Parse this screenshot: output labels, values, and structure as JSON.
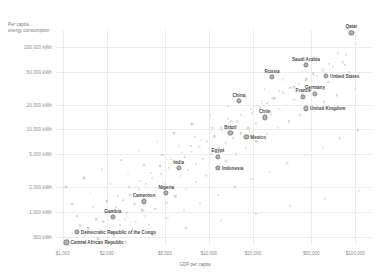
{
  "chart_data": {
    "type": "scatter",
    "title": "",
    "ylabel": "Per capita energy consumption",
    "ylabel_line1": "Per capita",
    "ylabel_line2": "energy consumption",
    "xlabel": "GDP per capita",
    "xscale": "log",
    "yscale": "log",
    "xlim": [
      900,
      130000
    ],
    "ylim": [
      400,
      160000
    ],
    "grid": true,
    "legend": "none",
    "xticks": [
      {
        "value": 1000,
        "label": "$1,000"
      },
      {
        "value": 2000,
        "label": "$2,000"
      },
      {
        "value": 5000,
        "label": "$5,000"
      },
      {
        "value": 10000,
        "label": "$10,000"
      },
      {
        "value": 20000,
        "label": "$20,000"
      },
      {
        "value": 50000,
        "label": "$50,000"
      },
      {
        "value": 100000,
        "label": "$100,000"
      }
    ],
    "yticks": [
      {
        "value": 100000,
        "label": "100,000 kWh"
      },
      {
        "value": 50000,
        "label": "50,000 kWh"
      },
      {
        "value": 20000,
        "label": "20,000 kWh"
      },
      {
        "value": 10000,
        "label": "10,000 kWh"
      },
      {
        "value": 5000,
        "label": "5,000 kWh"
      },
      {
        "value": 2000,
        "label": "2,000 kWh"
      },
      {
        "value": 1000,
        "label": "1,000 kWh"
      },
      {
        "value": 500,
        "label": "500 kWh"
      }
    ],
    "labeled_points": [
      {
        "name": "Qatar",
        "x": 94000,
        "y": 148000,
        "label_pos": "above"
      },
      {
        "name": "Saudi Arabia",
        "x": 46000,
        "y": 60000,
        "label_pos": "above"
      },
      {
        "name": "United States",
        "x": 63000,
        "y": 45000,
        "label_pos": "right"
      },
      {
        "name": "Russia",
        "x": 27000,
        "y": 43000,
        "label_pos": "above"
      },
      {
        "name": "Germany",
        "x": 53000,
        "y": 27000,
        "label_pos": "above"
      },
      {
        "name": "France",
        "x": 44000,
        "y": 25000,
        "label_pos": "above"
      },
      {
        "name": "United Kingdom",
        "x": 46000,
        "y": 18000,
        "label_pos": "right"
      },
      {
        "name": "China",
        "x": 16000,
        "y": 22000,
        "label_pos": "above"
      },
      {
        "name": "Chile",
        "x": 24000,
        "y": 14000,
        "label_pos": "above"
      },
      {
        "name": "Brazil",
        "x": 14000,
        "y": 9000,
        "label_pos": "above"
      },
      {
        "name": "Mexico",
        "x": 18000,
        "y": 8200,
        "label_pos": "right"
      },
      {
        "name": "Egypt",
        "x": 11500,
        "y": 4700,
        "label_pos": "above"
      },
      {
        "name": "Indonesia",
        "x": 11500,
        "y": 3400,
        "label_pos": "right"
      },
      {
        "name": "India",
        "x": 6200,
        "y": 3400,
        "label_pos": "above"
      },
      {
        "name": "Nigeria",
        "x": 5100,
        "y": 1700,
        "label_pos": "above"
      },
      {
        "name": "Cameroon",
        "x": 3600,
        "y": 1350,
        "label_pos": "above"
      },
      {
        "name": "Gambia",
        "x": 2200,
        "y": 870,
        "label_pos": "above"
      },
      {
        "name": "Democratic Republic of the Congo",
        "x": 1250,
        "y": 580,
        "label_pos": "right"
      },
      {
        "name": "Central African Republic",
        "x": 1060,
        "y": 430,
        "label_pos": "right"
      }
    ],
    "background_points": [
      {
        "x": 1180,
        "y": 560
      },
      {
        "x": 1320,
        "y": 700
      },
      {
        "x": 1500,
        "y": 640
      },
      {
        "x": 1700,
        "y": 820
      },
      {
        "x": 1900,
        "y": 760
      },
      {
        "x": 2050,
        "y": 1000
      },
      {
        "x": 2300,
        "y": 1150
      },
      {
        "x": 2450,
        "y": 700
      },
      {
        "x": 2600,
        "y": 1400
      },
      {
        "x": 2750,
        "y": 980
      },
      {
        "x": 2900,
        "y": 1600
      },
      {
        "x": 3100,
        "y": 1250
      },
      {
        "x": 3300,
        "y": 1900
      },
      {
        "x": 3500,
        "y": 1050
      },
      {
        "x": 3700,
        "y": 2200
      },
      {
        "x": 3900,
        "y": 1650
      },
      {
        "x": 4100,
        "y": 2600
      },
      {
        "x": 4400,
        "y": 1450
      },
      {
        "x": 4700,
        "y": 2900
      },
      {
        "x": 5000,
        "y": 2200
      },
      {
        "x": 5300,
        "y": 3400
      },
      {
        "x": 5600,
        "y": 1900
      },
      {
        "x": 6000,
        "y": 4000
      },
      {
        "x": 6400,
        "y": 2700
      },
      {
        "x": 6800,
        "y": 4600
      },
      {
        "x": 7200,
        "y": 3200
      },
      {
        "x": 7600,
        "y": 5400
      },
      {
        "x": 8100,
        "y": 3800
      },
      {
        "x": 8600,
        "y": 6200
      },
      {
        "x": 9100,
        "y": 4400
      },
      {
        "x": 9700,
        "y": 7200
      },
      {
        "x": 10300,
        "y": 5100
      },
      {
        "x": 10900,
        "y": 8300
      },
      {
        "x": 11600,
        "y": 6000
      },
      {
        "x": 12300,
        "y": 9500
      },
      {
        "x": 13000,
        "y": 6900
      },
      {
        "x": 13800,
        "y": 11000
      },
      {
        "x": 14700,
        "y": 7800
      },
      {
        "x": 15600,
        "y": 12500
      },
      {
        "x": 16500,
        "y": 9000
      },
      {
        "x": 17500,
        "y": 14000
      },
      {
        "x": 18600,
        "y": 10300
      },
      {
        "x": 19700,
        "y": 16000
      },
      {
        "x": 20900,
        "y": 11800
      },
      {
        "x": 22200,
        "y": 18500
      },
      {
        "x": 23500,
        "y": 13500
      },
      {
        "x": 25000,
        "y": 21000
      },
      {
        "x": 26500,
        "y": 15500
      },
      {
        "x": 28000,
        "y": 24000
      },
      {
        "x": 30000,
        "y": 17500
      },
      {
        "x": 32000,
        "y": 28000
      },
      {
        "x": 34000,
        "y": 20000
      },
      {
        "x": 36000,
        "y": 32000
      },
      {
        "x": 38000,
        "y": 23000
      },
      {
        "x": 41000,
        "y": 36000
      },
      {
        "x": 43000,
        "y": 26000
      },
      {
        "x": 46000,
        "y": 41000
      },
      {
        "x": 49000,
        "y": 30000
      },
      {
        "x": 52000,
        "y": 46000
      },
      {
        "x": 56000,
        "y": 34000
      },
      {
        "x": 60000,
        "y": 52000
      },
      {
        "x": 65000,
        "y": 38000
      },
      {
        "x": 70000,
        "y": 58000
      },
      {
        "x": 76000,
        "y": 43000
      },
      {
        "x": 82000,
        "y": 65000
      },
      {
        "x": 90000,
        "y": 49000
      },
      {
        "x": 1100,
        "y": 470
      },
      {
        "x": 1250,
        "y": 900
      },
      {
        "x": 1420,
        "y": 520
      },
      {
        "x": 1600,
        "y": 1150
      },
      {
        "x": 1800,
        "y": 600
      },
      {
        "x": 2000,
        "y": 1350
      },
      {
        "x": 2200,
        "y": 560
      },
      {
        "x": 2400,
        "y": 1550
      },
      {
        "x": 2650,
        "y": 820
      },
      {
        "x": 2850,
        "y": 2000
      },
      {
        "x": 3150,
        "y": 760
      },
      {
        "x": 3400,
        "y": 2400
      },
      {
        "x": 3650,
        "y": 900
      },
      {
        "x": 4000,
        "y": 3000
      },
      {
        "x": 4300,
        "y": 1100
      },
      {
        "x": 4600,
        "y": 3600
      },
      {
        "x": 5100,
        "y": 1300
      },
      {
        "x": 5500,
        "y": 4400
      },
      {
        "x": 5900,
        "y": 1550
      },
      {
        "x": 6500,
        "y": 5200
      },
      {
        "x": 7000,
        "y": 1900
      },
      {
        "x": 7500,
        "y": 6300
      },
      {
        "x": 8200,
        "y": 2300
      },
      {
        "x": 8900,
        "y": 7500
      },
      {
        "x": 9600,
        "y": 2800
      },
      {
        "x": 10400,
        "y": 9000
      },
      {
        "x": 11200,
        "y": 3400
      },
      {
        "x": 12100,
        "y": 10500
      },
      {
        "x": 13100,
        "y": 4100
      },
      {
        "x": 14200,
        "y": 12500
      },
      {
        "x": 15300,
        "y": 5000
      },
      {
        "x": 16600,
        "y": 15000
      },
      {
        "x": 18000,
        "y": 6000
      },
      {
        "x": 19500,
        "y": 17500
      },
      {
        "x": 21000,
        "y": 7200
      },
      {
        "x": 23000,
        "y": 20500
      },
      {
        "x": 25000,
        "y": 8800
      },
      {
        "x": 27000,
        "y": 24000
      },
      {
        "x": 29500,
        "y": 10500
      },
      {
        "x": 32000,
        "y": 28500
      },
      {
        "x": 35000,
        "y": 12500
      },
      {
        "x": 38000,
        "y": 33000
      },
      {
        "x": 42000,
        "y": 15000
      },
      {
        "x": 46000,
        "y": 39000
      },
      {
        "x": 50000,
        "y": 18000
      },
      {
        "x": 55000,
        "y": 45000
      },
      {
        "x": 61000,
        "y": 21500
      },
      {
        "x": 67000,
        "y": 53000
      },
      {
        "x": 75000,
        "y": 26000
      },
      {
        "x": 85000,
        "y": 61000
      },
      {
        "x": 100000,
        "y": 31000
      },
      {
        "x": 1150,
        "y": 1250
      },
      {
        "x": 1550,
        "y": 1700
      },
      {
        "x": 2100,
        "y": 2200
      },
      {
        "x": 2800,
        "y": 2900
      },
      {
        "x": 3600,
        "y": 3700
      },
      {
        "x": 4800,
        "y": 4900
      },
      {
        "x": 6200,
        "y": 6300
      },
      {
        "x": 8000,
        "y": 8100
      },
      {
        "x": 10500,
        "y": 10500
      },
      {
        "x": 13500,
        "y": 13500
      },
      {
        "x": 17500,
        "y": 17000
      },
      {
        "x": 23000,
        "y": 22000
      },
      {
        "x": 30000,
        "y": 29000
      },
      {
        "x": 39000,
        "y": 37000
      },
      {
        "x": 51000,
        "y": 48000
      },
      {
        "x": 66000,
        "y": 62000
      },
      {
        "x": 86000,
        "y": 80000
      },
      {
        "x": 1350,
        "y": 430
      },
      {
        "x": 1750,
        "y": 470
      },
      {
        "x": 2250,
        "y": 510
      },
      {
        "x": 3000,
        "y": 620
      },
      {
        "x": 3900,
        "y": 700
      },
      {
        "x": 5200,
        "y": 860
      },
      {
        "x": 6700,
        "y": 1050
      },
      {
        "x": 8700,
        "y": 1300
      },
      {
        "x": 11500,
        "y": 1600
      },
      {
        "x": 15000,
        "y": 2000
      },
      {
        "x": 19500,
        "y": 2500
      },
      {
        "x": 26000,
        "y": 3100
      },
      {
        "x": 34000,
        "y": 3900
      },
      {
        "x": 45000,
        "y": 4900
      },
      {
        "x": 60000,
        "y": 6200
      },
      {
        "x": 78000,
        "y": 7800
      },
      {
        "x": 104000,
        "y": 9800
      },
      {
        "x": 1050,
        "y": 2000
      },
      {
        "x": 1400,
        "y": 2600
      },
      {
        "x": 1850,
        "y": 3300
      },
      {
        "x": 2500,
        "y": 4300
      },
      {
        "x": 3300,
        "y": 5500
      },
      {
        "x": 4400,
        "y": 7000
      },
      {
        "x": 5800,
        "y": 9000
      },
      {
        "x": 7700,
        "y": 11500
      },
      {
        "x": 10200,
        "y": 14800
      },
      {
        "x": 13500,
        "y": 19000
      },
      {
        "x": 18000,
        "y": 24500
      },
      {
        "x": 24000,
        "y": 31000
      },
      {
        "x": 32000,
        "y": 40000
      },
      {
        "x": 43000,
        "y": 51000
      },
      {
        "x": 57000,
        "y": 66000
      },
      {
        "x": 76000,
        "y": 84000
      },
      {
        "x": 101000,
        "y": 108000
      },
      {
        "x": 2700,
        "y": 430
      },
      {
        "x": 4200,
        "y": 520
      },
      {
        "x": 7000,
        "y": 640
      },
      {
        "x": 12000,
        "y": 780
      },
      {
        "x": 21000,
        "y": 960
      },
      {
        "x": 36000,
        "y": 1180
      },
      {
        "x": 62000,
        "y": 1450
      },
      {
        "x": 106000,
        "y": 1800
      }
    ]
  }
}
